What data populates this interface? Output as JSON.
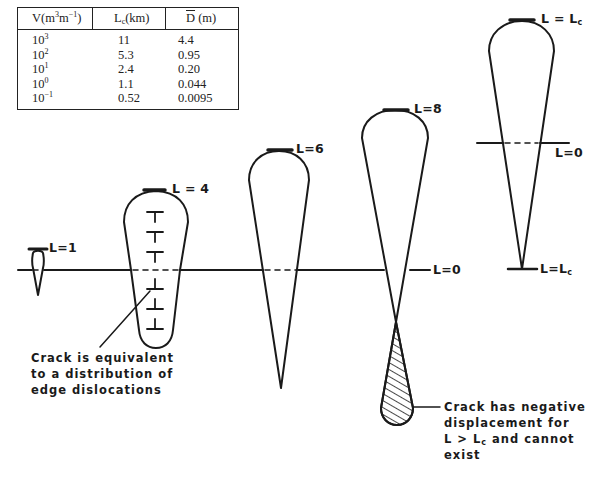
{
  "table": {
    "headers": {
      "volume": "V(m",
      "volume_sup1": "3",
      "volume_mid": "m",
      "volume_sup2": "−1",
      "volume_end": ")",
      "lc": "L",
      "lc_sub": "c",
      "lc_end": "(km)",
      "d": "D",
      "d_end": " (m)"
    },
    "rows": [
      {
        "v_base": "10",
        "v_exp": "3",
        "lc": "11",
        "d": "4.4"
      },
      {
        "v_base": "10",
        "v_exp": "2",
        "lc": "5.3",
        "d": "0.95"
      },
      {
        "v_base": "10",
        "v_exp": "1",
        "lc": "2.4",
        "d": "0.20"
      },
      {
        "v_base": "10",
        "v_exp": "0",
        "lc": "1.1",
        "d": "0.044"
      },
      {
        "v_base": "10",
        "v_exp": "−1",
        "lc": "0.52",
        "d": "0.0095"
      }
    ]
  },
  "labels": {
    "l1": "L=1",
    "l4": "L = 4",
    "l6": "L=6",
    "l8": "L=8",
    "l0_main": "L=0",
    "lc_top": "L = L",
    "lc_top_sub": "c",
    "l0_right": "L=0",
    "lc_bottom": "L=L",
    "lc_bottom_sub": "c"
  },
  "annotations": {
    "crack_equivalent": [
      "Crack is equivalent",
      "to a distribution of",
      "edge dislocations"
    ],
    "negative_displacement": {
      "line1": "Crack has negative",
      "line2": "displacement for",
      "line3_a": "L > L",
      "line3_sub": "c",
      "line3_b": " and cannot",
      "line4": "exist"
    }
  },
  "colors": {
    "ink": "#1a1a1a",
    "background": "#ffffff"
  }
}
